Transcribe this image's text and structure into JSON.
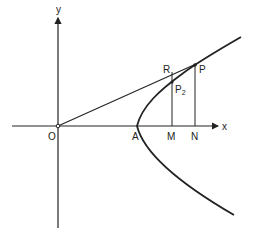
{
  "diagram": {
    "type": "geometry-figure",
    "colors": {
      "stroke": "#222222",
      "background": "#ffffff"
    },
    "axes": {
      "x_label": "x",
      "y_label": "y"
    },
    "points": {
      "origin": "O",
      "vertex": "A",
      "foot_m": "M",
      "foot_n": "N",
      "point_p": "P",
      "point_p2_base": "P",
      "point_p2_sub": "2",
      "point_r": "R"
    }
  }
}
